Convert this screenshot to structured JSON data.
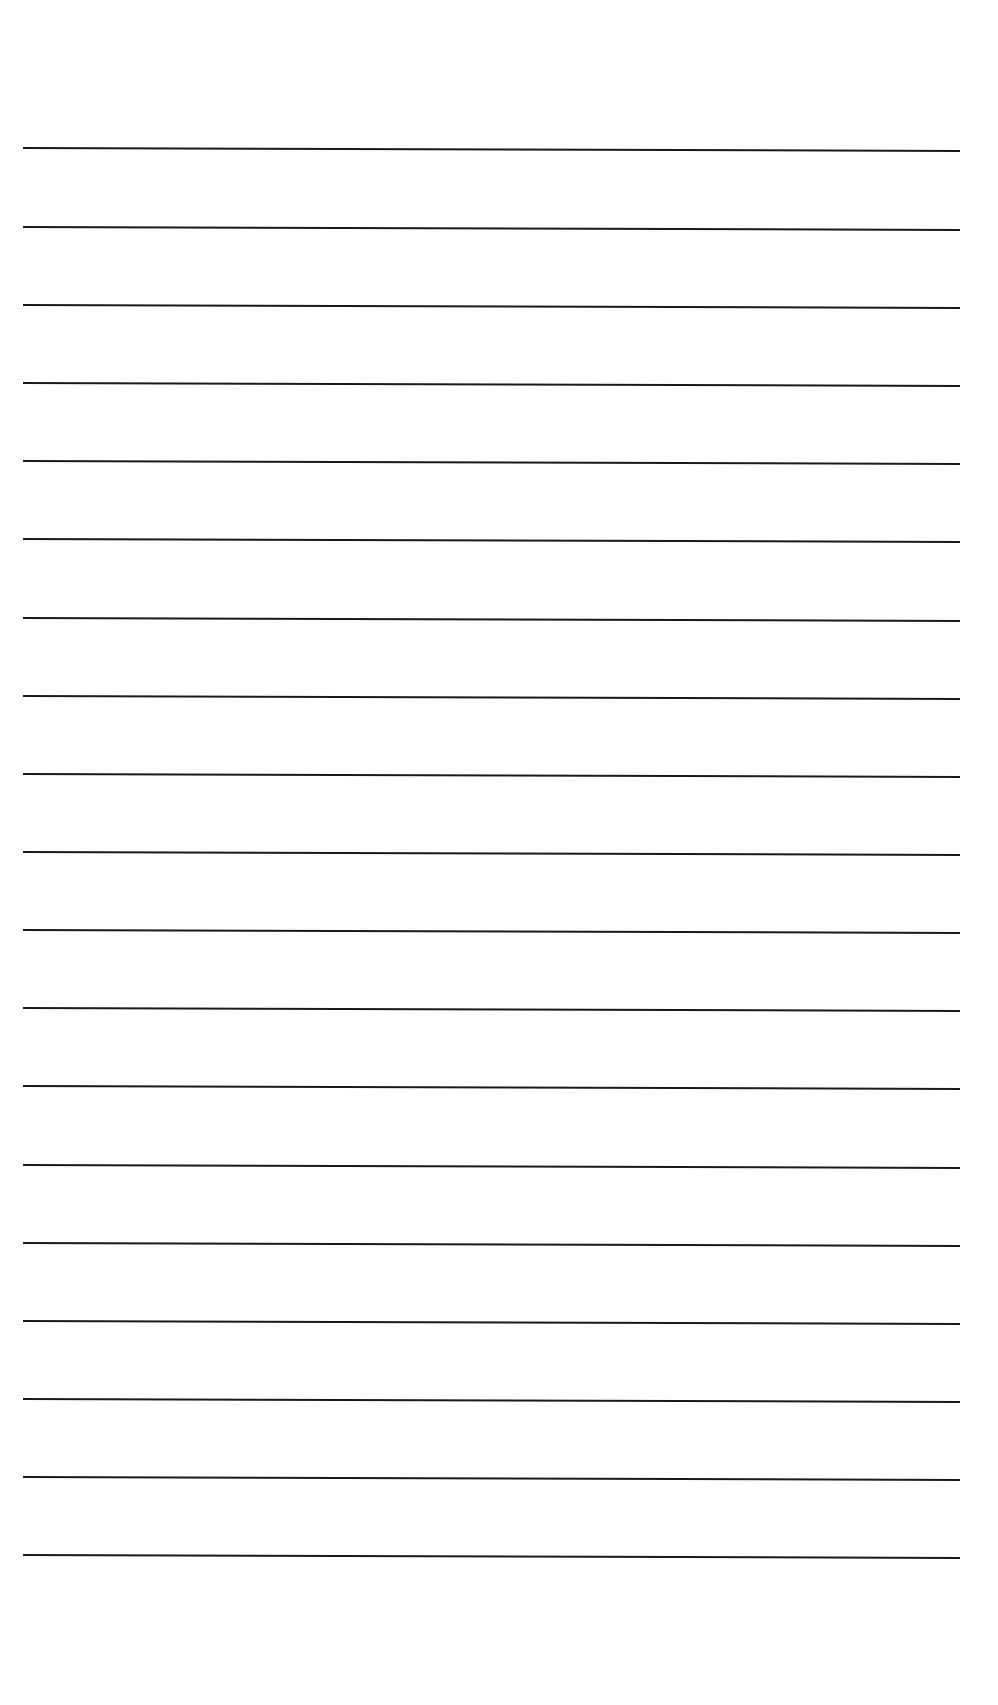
{
  "page": {
    "type": "ruled-blank-sheet",
    "background_color": "#ffffff",
    "line_color": "#1a1a1a",
    "line_thickness_px": 2,
    "line_start_x": 23,
    "line_end_x": 960,
    "line_count": 19,
    "line_y_positions": [
      149,
      228,
      306,
      384,
      462,
      540,
      619,
      697,
      775,
      853,
      931,
      1009,
      1087,
      1166,
      1244,
      1322,
      1400,
      1478,
      1556
    ]
  }
}
